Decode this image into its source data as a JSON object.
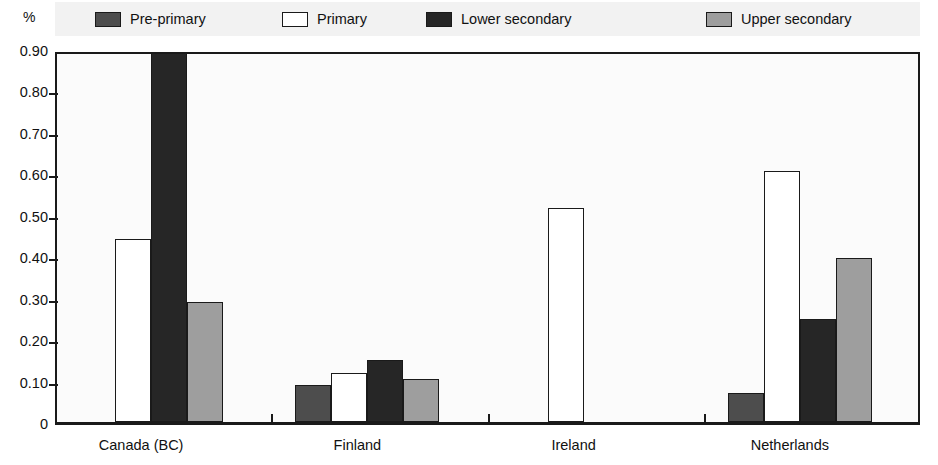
{
  "unit_label": "%",
  "legend": {
    "items": [
      {
        "key": "pre_primary",
        "label": "Pre-primary",
        "color": "#4d4d4d"
      },
      {
        "key": "primary",
        "label": "Primary",
        "color": "#ffffff"
      },
      {
        "key": "lower_secondary",
        "label": "Lower secondary",
        "color": "#262626"
      },
      {
        "key": "upper_secondary",
        "label": "Upper secondary",
        "color": "#9e9e9e"
      }
    ]
  },
  "axis": {
    "y_ticks": [
      "0.90",
      "0.80",
      "0.70",
      "0.60",
      "0.50",
      "0.40",
      "0.30",
      "0.20",
      "0.10",
      "0"
    ],
    "x_categories": [
      "Canada (BC)",
      "Finland",
      "Ireland",
      "Netherlands"
    ]
  },
  "chart_data": {
    "type": "bar",
    "title": "",
    "xlabel": "",
    "ylabel": "%",
    "ylim": [
      0,
      0.9
    ],
    "ytick_values": [
      0,
      0.1,
      0.2,
      0.3,
      0.4,
      0.5,
      0.6,
      0.7,
      0.8,
      0.9
    ],
    "ytick_labels": [
      "0",
      "0.10",
      "0.20",
      "0.30",
      "0.40",
      "0.50",
      "0.60",
      "0.70",
      "0.80",
      "0.90"
    ],
    "grid": false,
    "legend_position": "top",
    "categories": [
      "Canada (BC)",
      "Finland",
      "Ireland",
      "Netherlands"
    ],
    "series": [
      {
        "name": "Pre-primary",
        "color": "#4d4d4d",
        "values": [
          0.0,
          0.09,
          0.0,
          0.07
        ]
      },
      {
        "name": "Primary",
        "color": "#ffffff",
        "values": [
          0.445,
          0.12,
          0.52,
          0.61
        ]
      },
      {
        "name": "Lower secondary",
        "color": "#262626",
        "values": [
          0.93,
          0.15,
          0.0,
          0.25
        ],
        "clipped": [
          true,
          false,
          false,
          false
        ]
      },
      {
        "name": "Upper secondary",
        "color": "#9e9e9e",
        "values": [
          0.293,
          0.105,
          0.0,
          0.4
        ]
      }
    ]
  }
}
